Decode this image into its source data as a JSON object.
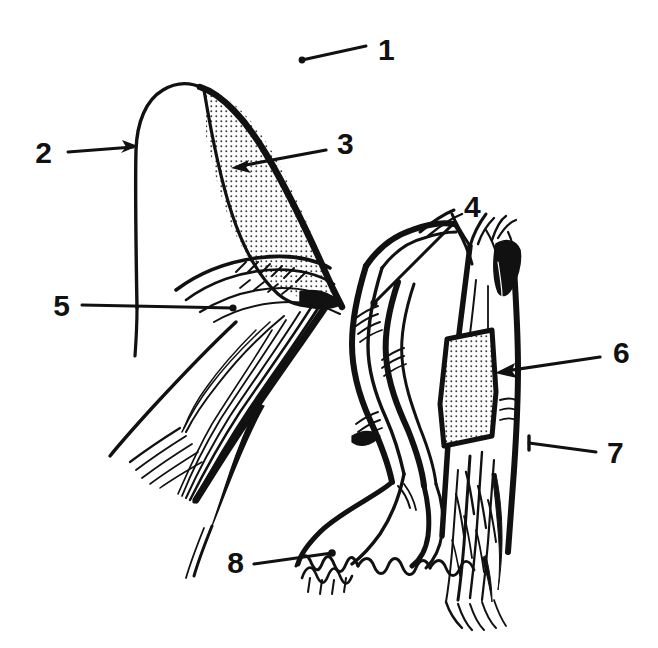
{
  "figure": {
    "style": "black-and-white hand-drawn scientific line illustration",
    "background_color": "#ffffff",
    "ink_color": "#111111",
    "stipple_color": "#3a3a3a",
    "canvas": {
      "width": 658,
      "height": 648
    }
  },
  "labels": [
    {
      "id": "1",
      "text": "1",
      "text_x": 378,
      "text_y": 52,
      "leader": {
        "type": "line-with-dot",
        "x1": 366,
        "y1": 46,
        "x2": 302,
        "y2": 60,
        "dot_x": 302,
        "dot_y": 60
      }
    },
    {
      "id": "2",
      "text": "2",
      "text_x": 52,
      "text_y": 155,
      "leader": {
        "type": "arrow-right",
        "x1": 68,
        "y1": 152,
        "x2": 137,
        "y2": 146
      }
    },
    {
      "id": "3",
      "text": "3",
      "text_x": 337,
      "text_y": 146,
      "leader": {
        "type": "arrow-left",
        "x1": 326,
        "y1": 150,
        "x2": 232,
        "y2": 168
      }
    },
    {
      "id": "4",
      "text": "4",
      "text_x": 464,
      "text_y": 209,
      "leader": {
        "type": "line-with-dot",
        "x1": 455,
        "y1": 220,
        "x2": 374,
        "y2": 303,
        "dot_x": 374,
        "dot_y": 303
      }
    },
    {
      "id": "5",
      "text": "5",
      "text_x": 64,
      "text_y": 308,
      "leader": {
        "type": "line-with-dot",
        "x1": 82,
        "y1": 304,
        "x2": 233,
        "y2": 308,
        "dot_x": 233,
        "dot_y": 308
      }
    },
    {
      "id": "6",
      "text": "6",
      "text_x": 613,
      "text_y": 355,
      "leader": {
        "type": "arrow-left",
        "x1": 600,
        "y1": 357,
        "x2": 497,
        "y2": 372
      }
    },
    {
      "id": "7",
      "text": "7",
      "text_x": 607,
      "text_y": 455,
      "leader": {
        "type": "line-with-tick",
        "x1": 596,
        "y1": 452,
        "x2": 528,
        "y2": 443,
        "tick_x": 528,
        "tick_y": 443
      }
    },
    {
      "id": "8",
      "text": "8",
      "text_x": 238,
      "text_y": 565,
      "leader": {
        "type": "line-with-dot",
        "x1": 254,
        "y1": 562,
        "x2": 332,
        "y2": 553,
        "dot_x": 332,
        "dot_y": 553
      }
    }
  ],
  "regions": [
    {
      "name": "left-appendage-body",
      "description": "large dome-topped left structure with thin outline"
    },
    {
      "name": "left-stippled-wedge",
      "description": "stippled tapering wedge on the right face of the left structure",
      "shaded": true
    },
    {
      "name": "left-bristle-tuft",
      "description": "feathery bristle strokes emerging below the left structure"
    },
    {
      "name": "middle-twisted-stalk",
      "description": "braided / twisted double stalk in the center of the figure"
    },
    {
      "name": "middle-basal-fringe",
      "description": "serrated zigzag fringe at the base of the twisted stalk"
    },
    {
      "name": "right-columnar-stalk",
      "description": "tall right-hand columnar structure with forked apex"
    },
    {
      "name": "right-stippled-patch",
      "description": "stippled quadrilateral patch on the right structure",
      "shaded": true
    },
    {
      "name": "right-dark-apex",
      "description": "solid black filled area at the apex of the right structure"
    }
  ]
}
